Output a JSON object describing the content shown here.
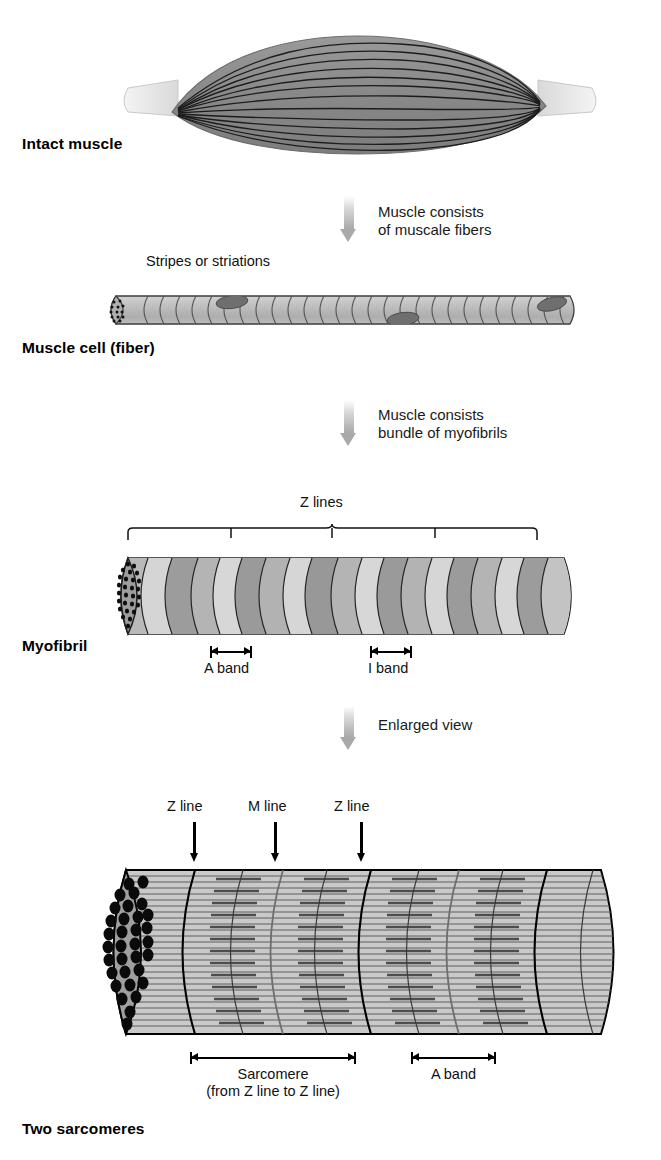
{
  "figure": {
    "width": 661,
    "height": 1160,
    "background": "#ffffff"
  },
  "colors": {
    "muscle_belly": "#8a8a8a",
    "tendon": "#e4e4e4",
    "fiber_line": "#1a1a1a",
    "cell_body_light": "#c4c4c4",
    "cell_body_dark": "#9d9d9d",
    "nucleus": "#6f6f6f",
    "myofibril_light": "#cbcbcb",
    "myofibril_mid": "#a8a8a8",
    "myofibril_dark": "#8d8d8d",
    "sarcomere_fill": "#c9c9c9",
    "endcap_fill": "#9e9e9e",
    "filament_line": "#4a4a4a",
    "myosin_line": "#5a5a5a",
    "z_line": "#000000",
    "m_line": "#707070",
    "flow_arrow": "#a9a9a9",
    "outline": "#000000"
  },
  "stages": [
    {
      "id": "intact-muscle",
      "label": "Intact muscle",
      "label_pos": {
        "x": 22,
        "y": 145
      }
    },
    {
      "id": "muscle-cell",
      "label": "Muscle cell (fiber)",
      "label_pos": {
        "x": 22,
        "y": 347
      }
    },
    {
      "id": "myofibril",
      "label": "Myofibril",
      "label_pos": {
        "x": 22,
        "y": 645
      }
    },
    {
      "id": "two-sarcomeres",
      "label": "Two sarcomeres",
      "label_pos": {
        "x": 22,
        "y": 1128
      }
    }
  ],
  "transitions": [
    {
      "id": "muscle-to-fiber",
      "text": "Muscle consists\nof muscale fibers",
      "text_pos": {
        "x": 378,
        "y": 206
      },
      "arrow_pos": {
        "x": 340,
        "y": 196
      },
      "arrow_height": 46
    },
    {
      "id": "fiber-to-myofibril",
      "text": "Muscle consists\nbundle of myofibrils",
      "text_pos": {
        "x": 378,
        "y": 408
      },
      "arrow_pos": {
        "x": 340,
        "y": 400
      },
      "arrow_height": 46
    },
    {
      "id": "myofibril-to-sarcomere",
      "text": "Enlarged view",
      "text_pos": {
        "x": 378,
        "y": 718
      },
      "arrow_pos": {
        "x": 340,
        "y": 706
      },
      "arrow_height": 44
    }
  ],
  "annotations": {
    "stripes": {
      "text": "Stripes or striations",
      "pos": {
        "x": 146,
        "y": 252
      }
    },
    "z_lines_bracket": {
      "text": "Z lines",
      "text_pos": {
        "x": 300,
        "y": 501
      },
      "bracket": {
        "x": 128,
        "y": 528,
        "width": 414,
        "segments": 4
      }
    },
    "myofibril_bands": [
      {
        "name": "A band",
        "label": "A band",
        "bar": {
          "x": 210,
          "y": 649,
          "width": 42
        },
        "label_pos": {
          "x": 231,
          "y": 666
        }
      },
      {
        "name": "I band",
        "label": "I band",
        "bar": {
          "x": 370,
          "y": 649,
          "width": 42
        },
        "label_pos": {
          "x": 391,
          "y": 666
        }
      }
    ],
    "sarcomere_callouts": [
      {
        "name": "z-line-left",
        "label": "Z line",
        "label_pos": {
          "x": 194,
          "y": 806
        },
        "arrow": {
          "x": 190,
          "y": 822,
          "height": 36
        }
      },
      {
        "name": "m-line",
        "label": "M line",
        "label_pos": {
          "x": 275,
          "y": 806
        },
        "arrow": {
          "x": 271,
          "y": 822,
          "height": 36
        }
      },
      {
        "name": "z-line-right",
        "label": "Z line",
        "label_pos": {
          "x": 361,
          "y": 806
        },
        "arrow": {
          "x": 357,
          "y": 822,
          "height": 36
        }
      }
    ],
    "sarcomere_bands": [
      {
        "name": "sarcomere",
        "label": "Sarcomere\n(from Z line to Z line)",
        "bar": {
          "x": 190,
          "y": 1052,
          "width": 166
        },
        "label_pos": {
          "x": 273,
          "y": 1069
        }
      },
      {
        "name": "a-band-lower",
        "label": "A band",
        "bar": {
          "x": 411,
          "y": 1052,
          "width": 85
        },
        "label_pos": {
          "x": 453,
          "y": 1069
        }
      }
    ]
  },
  "geometry": {
    "intact_muscle": {
      "belly_left": 170,
      "belly_right": 546,
      "center_y": 98,
      "belly_half_height": 48,
      "fiber_count": 13
    },
    "muscle_cell": {
      "x": 108,
      "y": 294,
      "width": 466,
      "height": 38,
      "striation_count": 27,
      "nuclei": [
        {
          "cx": 232,
          "cy": 302,
          "rx": 16,
          "ry": 7,
          "rot": -8
        },
        {
          "cx": 403,
          "cy": 325,
          "rx": 16,
          "ry": 7,
          "rot": -8
        },
        {
          "cx": 553,
          "cy": 303,
          "rx": 15,
          "ry": 7,
          "rot": -14
        }
      ],
      "endcap_dots": 13
    },
    "myofibril": {
      "x": 112,
      "y": 560,
      "width": 462,
      "height": 72,
      "disc_count": 22,
      "endcap_dots": 26
    },
    "sarcomere": {
      "x": 100,
      "y": 868,
      "width": 530,
      "height": 168,
      "endcap_dots": 31,
      "filament_rows": 30,
      "z_lines": [
        195,
        370,
        545
      ],
      "m_lines": [
        283,
        458
      ],
      "extra_discs": [
        243,
        325,
        418,
        500,
        590
      ]
    }
  }
}
